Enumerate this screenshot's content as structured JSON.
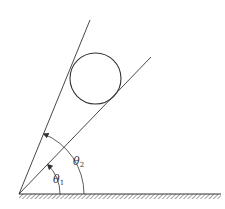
{
  "diagram": {
    "colors": {
      "stroke": "#333333",
      "background": "#ffffff"
    },
    "labels": {
      "theta1": {
        "symbol": "θ",
        "subscript": "1"
      },
      "theta2": {
        "symbol": "θ",
        "subscript": "2"
      }
    },
    "elements": {
      "origin": [
        19,
        194
      ],
      "ground": {
        "x1": 19,
        "x2": 221,
        "y": 194
      },
      "line_lower": {
        "angle_deg": 46,
        "end": [
          151,
          57
        ]
      },
      "line_upper": {
        "angle_deg": 68,
        "end": [
          90,
          20
        ]
      },
      "circle": {
        "cx": 95.5,
        "cy": 78.5,
        "r": 25.5
      },
      "arc_theta1_radius": 41,
      "arc_theta2_radius": 65
    }
  }
}
